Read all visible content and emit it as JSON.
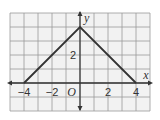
{
  "chart_data": {
    "type": "line",
    "title": "",
    "xlabel": "x",
    "ylabel": "y",
    "origin_label": "O",
    "xlim": [
      -5,
      5
    ],
    "ylim": [
      -2,
      5
    ],
    "grid": true,
    "grid_step": 1,
    "x_tick_labels": [
      {
        "value": -4,
        "label": "−4"
      },
      {
        "value": -2,
        "label": "−2"
      },
      {
        "value": 2,
        "label": "2"
      },
      {
        "value": 4,
        "label": "4"
      }
    ],
    "y_tick_labels": [
      {
        "value": 2,
        "label": "2"
      }
    ],
    "series": [
      {
        "name": "graph",
        "points": [
          [
            -4,
            0
          ],
          [
            0,
            4
          ],
          [
            4,
            0
          ]
        ]
      }
    ],
    "colors": {
      "grid_bg": "#f2f2f2",
      "grid_line": "#9a9a9a",
      "axis": "#333333",
      "curve": "#333333"
    }
  }
}
